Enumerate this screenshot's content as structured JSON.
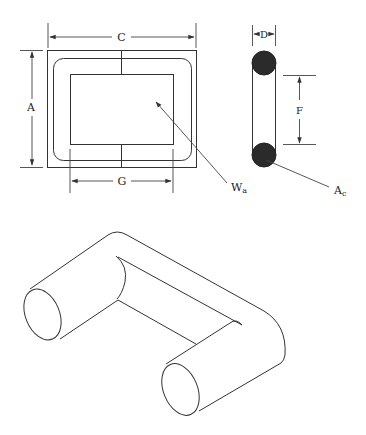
{
  "diagram": {
    "type": "transformer-core-dimensions",
    "colors": {
      "line": "#333333",
      "conductor_fill": "#2b2b2b",
      "background": "#ffffff"
    },
    "front_view": {
      "labels": {
        "C": "C",
        "A": "A",
        "G": "G"
      },
      "window_label": {
        "main": "W",
        "sub": "a"
      }
    },
    "side_view": {
      "labels": {
        "D": "D",
        "F": "F"
      },
      "core_label": {
        "main": "A",
        "sub": "c"
      }
    },
    "isometric_view": {
      "description": "C-core half shown in isometric projection"
    }
  }
}
